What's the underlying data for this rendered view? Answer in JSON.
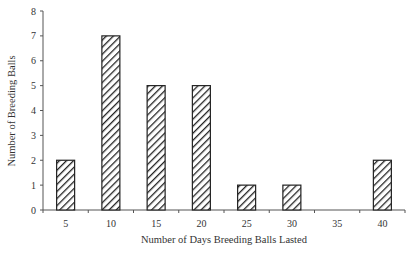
{
  "chart_data": {
    "type": "bar",
    "title": "",
    "xlabel": "Number of Days Breeding Balls Lasted",
    "ylabel": "Number of Breeding Balls",
    "categories": [
      "5",
      "10",
      "15",
      "20",
      "25",
      "30",
      "35",
      "40"
    ],
    "values": [
      2,
      7,
      5,
      5,
      1,
      1,
      0,
      2
    ],
    "ylim": [
      0,
      8
    ],
    "yticks": [
      0,
      1,
      2,
      3,
      4,
      5,
      6,
      7,
      8
    ],
    "grid": false,
    "legend": null,
    "bar_fill": "diagonal-hatch",
    "colors": {
      "bar_stroke": "#222222",
      "hatch": "#222222",
      "axis": "#555555"
    }
  }
}
